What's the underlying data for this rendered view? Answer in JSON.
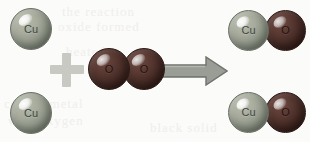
{
  "diagram": {
    "type": "chemical-reaction-particle-diagram",
    "equation": "2 Cu + O2 -> 2 CuO",
    "background_color": "#fbfbfa",
    "colors": {
      "copper_atom": "#8f9588",
      "copper_atom_outline": "#6a7065",
      "oxygen_atom": "#4a2e28",
      "oxygen_atom_outline": "#2b1815",
      "plus_sign": "#c8c9c3",
      "arrow_fill": "#9a9c96",
      "arrow_outline": "#6f726c",
      "label_text_copper": "#3f4640",
      "label_text_oxygen": "#241310"
    },
    "reactants": {
      "copper_atoms": [
        {
          "label": "Cu",
          "name": "copper-atom-top"
        },
        {
          "label": "Cu",
          "name": "copper-atom-bottom"
        }
      ],
      "oxygen_molecule": {
        "name": "oxygen-molecule",
        "atoms": [
          {
            "label": "O"
          },
          {
            "label": "O"
          }
        ]
      }
    },
    "operators": {
      "plus": "+",
      "arrow": "yields"
    },
    "products": {
      "molecules": [
        {
          "name": "copper-oxide-molecule-top",
          "atoms": [
            {
              "label": "Cu",
              "element": "copper"
            },
            {
              "label": "O",
              "element": "oxygen"
            }
          ]
        },
        {
          "name": "copper-oxide-molecule-bottom",
          "atoms": [
            {
              "label": "Cu",
              "element": "copper"
            },
            {
              "label": "O",
              "element": "oxygen"
            }
          ]
        }
      ]
    },
    "ghost_text": {
      "line1": "the reaction",
      "line2": "oxide formed",
      "line3": "heated",
      "line4": "copper metal",
      "line5": "with oxygen",
      "line6": "black solid"
    }
  }
}
